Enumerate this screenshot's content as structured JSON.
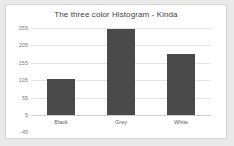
{
  "chart_data": {
    "type": "bar",
    "title": "The three color Histogram - Kinda",
    "categories": [
      "Black",
      "Grey",
      "White"
    ],
    "values": [
      108,
      252,
      180
    ],
    "series": [
      {
        "name": "Histogram",
        "values": [
          108,
          252,
          180
        ]
      }
    ],
    "xlabel": "",
    "ylabel": "",
    "ylim": [
      -45,
      255
    ],
    "yticks": [
      255,
      205,
      155,
      105,
      55,
      5,
      -45
    ],
    "ytick_labels": [
      "255",
      "205",
      "155",
      "105",
      "55",
      "5",
      "-45"
    ],
    "grid": true,
    "legend": false,
    "bar_color": "#4a4a4a",
    "plot_background": "#ffffff",
    "page_background": "#e9e9e9",
    "gridline_color": "#e4e4e4",
    "title_color": "#3f3f3f",
    "tick_label_color": "#7a7a7a"
  }
}
